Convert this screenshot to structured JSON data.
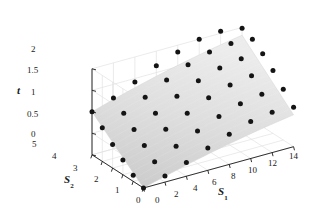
{
  "figure": {
    "kind": "3d-surface-scatter",
    "background": "#ffffff",
    "ink": "#1a1a1a",
    "surface_light": "#ececec",
    "surface_dark": "#c9c9c9",
    "grid_color": "#e3e3e3",
    "point_color": "#141414"
  },
  "axes": {
    "t": {
      "name": "t",
      "ticks": [
        "0",
        "0.5",
        "1",
        "1.5",
        "2"
      ],
      "values": [
        0,
        0.5,
        1,
        1.5,
        2
      ],
      "range": [
        0,
        2
      ]
    },
    "s1": {
      "name": "S",
      "subscript": "1",
      "ticks": [
        "0",
        "2",
        "4",
        "6",
        "8",
        "10",
        "12",
        "14"
      ],
      "values": [
        0,
        2,
        4,
        6,
        8,
        10,
        12,
        14
      ],
      "range": [
        0,
        14
      ]
    },
    "s2": {
      "name": "S",
      "subscript": "2",
      "ticks": [
        "0",
        "1",
        "2",
        "3",
        "4",
        "5"
      ],
      "values": [
        0,
        1,
        2,
        3,
        4,
        5
      ],
      "range": [
        0,
        5
      ]
    }
  },
  "chart_data": {
    "type": "scatter",
    "title": "",
    "xlabel": "S_1",
    "ylabel": "S_2",
    "zlabel": "t",
    "xlim": [
      0,
      14
    ],
    "ylim": [
      0,
      5
    ],
    "zlim": [
      0,
      2
    ],
    "grid": true,
    "legend": "none",
    "surface": {
      "description": "smooth saddle-like fitted response surface rising toward large S_1 and large S_2",
      "shading": "light-gray gradient, darker at low t, lighter at high t"
    },
    "series": [
      {
        "name": "observed data points",
        "marker": "filled-circle",
        "color": "#141414",
        "points": [
          {
            "s1": 0,
            "s2": 5,
            "t": 1.0
          },
          {
            "s1": 2,
            "s2": 5,
            "t": 1.18
          },
          {
            "s1": 4,
            "s2": 5,
            "t": 1.42
          },
          {
            "s1": 6,
            "s2": 5,
            "t": 1.66
          },
          {
            "s1": 8,
            "s2": 5,
            "t": 1.84
          },
          {
            "s1": 10,
            "s2": 5,
            "t": 2.0
          },
          {
            "s1": 12,
            "s2": 5,
            "t": 2.05
          },
          {
            "s1": 14,
            "s2": 5,
            "t": 1.98
          },
          {
            "s1": 0,
            "s2": 4,
            "t": 0.78
          },
          {
            "s1": 2,
            "s2": 4,
            "t": 0.98
          },
          {
            "s1": 4,
            "s2": 4,
            "t": 1.22
          },
          {
            "s1": 6,
            "s2": 4,
            "t": 1.48
          },
          {
            "s1": 8,
            "s2": 4,
            "t": 1.7
          },
          {
            "s1": 10,
            "s2": 4,
            "t": 1.86
          },
          {
            "s1": 12,
            "s2": 4,
            "t": 1.92
          },
          {
            "s1": 14,
            "s2": 4,
            "t": 1.88
          },
          {
            "s1": 0,
            "s2": 3,
            "t": 0.55
          },
          {
            "s1": 2,
            "s2": 3,
            "t": 0.76
          },
          {
            "s1": 4,
            "s2": 3,
            "t": 1.0
          },
          {
            "s1": 6,
            "s2": 3,
            "t": 1.26
          },
          {
            "s1": 8,
            "s2": 3,
            "t": 1.48
          },
          {
            "s1": 10,
            "s2": 3,
            "t": 1.64
          },
          {
            "s1": 12,
            "s2": 3,
            "t": 1.72
          },
          {
            "s1": 14,
            "s2": 3,
            "t": 1.7
          },
          {
            "s1": 0,
            "s2": 2,
            "t": 0.34
          },
          {
            "s1": 2,
            "s2": 2,
            "t": 0.54
          },
          {
            "s1": 4,
            "s2": 2,
            "t": 0.78
          },
          {
            "s1": 6,
            "s2": 2,
            "t": 1.02
          },
          {
            "s1": 8,
            "s2": 2,
            "t": 1.24
          },
          {
            "s1": 10,
            "s2": 2,
            "t": 1.4
          },
          {
            "s1": 12,
            "s2": 2,
            "t": 1.48
          },
          {
            "s1": 14,
            "s2": 2,
            "t": 1.46
          },
          {
            "s1": 0,
            "s2": 1,
            "t": 0.14
          },
          {
            "s1": 2,
            "s2": 1,
            "t": 0.32
          },
          {
            "s1": 4,
            "s2": 1,
            "t": 0.54
          },
          {
            "s1": 6,
            "s2": 1,
            "t": 0.76
          },
          {
            "s1": 8,
            "s2": 1,
            "t": 0.96
          },
          {
            "s1": 10,
            "s2": 1,
            "t": 1.12
          },
          {
            "s1": 12,
            "s2": 1,
            "t": 1.2
          },
          {
            "s1": 14,
            "s2": 1,
            "t": 1.18
          },
          {
            "s1": 0,
            "s2": 0,
            "t": 0.0
          },
          {
            "s1": 2,
            "s2": 0,
            "t": 0.14
          },
          {
            "s1": 4,
            "s2": 0,
            "t": 0.32
          },
          {
            "s1": 6,
            "s2": 0,
            "t": 0.52
          },
          {
            "s1": 8,
            "s2": 0,
            "t": 0.7
          },
          {
            "s1": 10,
            "s2": 0,
            "t": 0.86
          },
          {
            "s1": 12,
            "s2": 0,
            "t": 0.94
          },
          {
            "s1": 14,
            "s2": 0,
            "t": 0.92
          }
        ]
      }
    ]
  }
}
